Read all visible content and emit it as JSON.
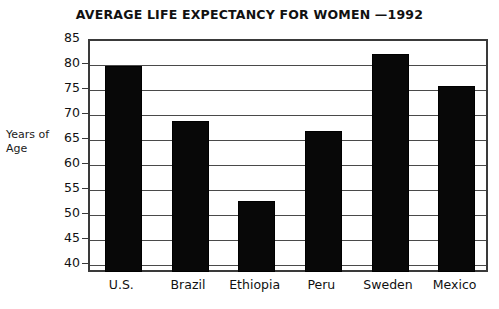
{
  "chart_data": {
    "type": "bar",
    "title": "AVERAGE LIFE EXPECTANCY FOR WOMEN —1992",
    "xlabel": "",
    "ylabel": "Years of Age",
    "ylabel_lines": [
      "Years of",
      "Age"
    ],
    "categories": [
      "U.S.",
      "Brazil",
      "Ethiopia",
      "Peru",
      "Sweden",
      "Mexico"
    ],
    "values": [
      80,
      69,
      53,
      67,
      82.5,
      76
    ],
    "ylim": [
      38.4,
      85
    ],
    "ytick_labels": [
      "85",
      "80",
      "75",
      "70",
      "65",
      "60",
      "55",
      "50",
      "45",
      "40"
    ],
    "ytick_values": [
      85,
      80,
      75,
      70,
      65,
      60,
      55,
      50,
      45,
      40
    ],
    "grid": true,
    "legend": false,
    "bar_color": "#080808",
    "axis_color": "#3a3a3a"
  }
}
